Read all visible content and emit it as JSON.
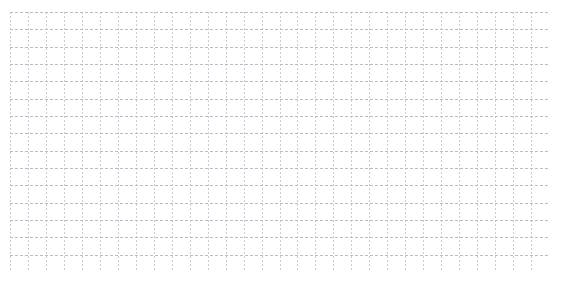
{
  "page": {
    "kind": "grid-paper",
    "width": 564,
    "height": 284,
    "background_color": "#ffffff"
  },
  "sheet": {
    "label": "grid-sheet",
    "x": 10,
    "y": 12,
    "width": 539,
    "height": 260,
    "background_color": "#ffffff"
  },
  "grid": {
    "label": "dotted-grid",
    "columns": 30,
    "rows": 15,
    "cell_width": 17.97,
    "cell_height": 17.33,
    "vertical_line_color": "#c8ccd4",
    "horizontal_line_color": "#b8bdc6",
    "vertical_dash": "2 2",
    "horizontal_dash": "3 2",
    "line_width": 1,
    "border_color": "#c4c9d2"
  },
  "content": {
    "text_items": [],
    "note": ""
  }
}
